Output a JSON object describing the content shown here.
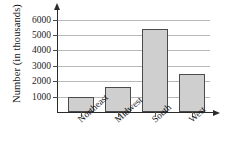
{
  "chart_data": {
    "type": "bar",
    "title": "",
    "xlabel": "",
    "ylabel": "Number (in thousands)",
    "categories": [
      "Northeast",
      "Midwest",
      "South",
      "West"
    ],
    "values": [
      1000,
      1600,
      5400,
      2500
    ],
    "ylim": [
      0,
      6500
    ],
    "yticks": [
      1000,
      2000,
      3000,
      4000,
      5000,
      6000
    ],
    "ytick_labels": [
      "1000",
      "2000",
      "3000",
      "4000",
      "5000",
      "6000"
    ],
    "grid": true,
    "legend": "none",
    "bar_fill_color": "#cfcfcf",
    "bar_edge_color": "#4b4b4b",
    "axis_color": "#2b2b2b",
    "gridline_color": "#b9b9b9"
  }
}
